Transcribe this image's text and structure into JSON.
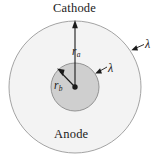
{
  "figure": {
    "labels": {
      "cathode": "Cathode",
      "anode": "Anode",
      "radius_outer_symbol": "r",
      "radius_outer_subscript": "a",
      "radius_inner_symbol": "r",
      "radius_inner_subscript": "b",
      "lambda_outer": "λ",
      "lambda_inner": "λ"
    },
    "colors": {
      "background": "#ffffff",
      "outer_disc_fill": "#f2f2f2",
      "inner_disc_fill": "#cfcfcf",
      "stroke": "#6e6e6e",
      "line": "#1a1a1a",
      "text": "#1a1a1a"
    },
    "geometry": {
      "center_x": 75,
      "center_y": 87,
      "outer_radius": 66,
      "inner_radius": 24,
      "center_dot_radius": 2.6
    }
  }
}
